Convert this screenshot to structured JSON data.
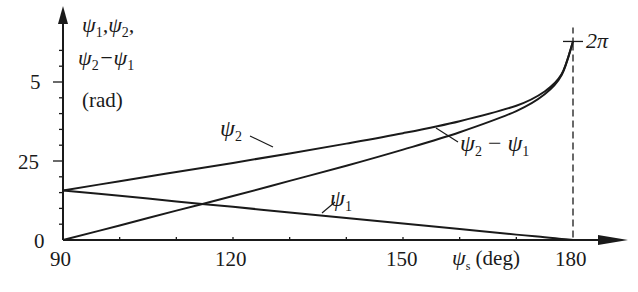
{
  "chart_data": {
    "type": "line",
    "title": "",
    "xlabel": "ψs (deg)",
    "ylabel": "ψ1, ψ2, ψ2−ψ1 (rad)",
    "xlim": [
      90,
      180
    ],
    "ylim": [
      0,
      6.6
    ],
    "x_ticks": [
      90,
      120,
      150,
      180
    ],
    "y_ticks": [
      "0",
      "25",
      "5"
    ],
    "y_tick_values": [
      0,
      2.5,
      5
    ],
    "grid": false,
    "annotations": [
      "2π",
      "dashed vertical line at ψs = 180"
    ],
    "x": [
      90,
      100,
      110,
      120,
      130,
      140,
      150,
      160,
      170,
      175,
      178,
      180
    ],
    "series": [
      {
        "name": "ψ1",
        "values": [
          1.57,
          1.4,
          1.22,
          1.05,
          0.87,
          0.7,
          0.52,
          0.35,
          0.17,
          0.09,
          0.03,
          0.0
        ]
      },
      {
        "name": "ψ2",
        "values": [
          1.57,
          1.86,
          2.15,
          2.44,
          2.74,
          3.05,
          3.38,
          3.76,
          4.25,
          4.7,
          5.25,
          6.28
        ]
      },
      {
        "name": "ψ2 − ψ1",
        "values": [
          0.0,
          0.46,
          0.93,
          1.39,
          1.87,
          2.35,
          2.86,
          3.41,
          4.08,
          4.61,
          5.22,
          6.28
        ]
      }
    ]
  },
  "labels": {
    "y_axis_line1": "ψ1,ψ2,",
    "y_axis_line2": "ψ2−ψ1",
    "y_unit": "(rad)",
    "x_axis_symbol": "ψ",
    "x_axis_sub": "s",
    "x_axis_unit": "(deg)",
    "two_pi": "2π",
    "psi": "ψ",
    "sub1": "1",
    "sub2": "2",
    "minus": " − "
  }
}
